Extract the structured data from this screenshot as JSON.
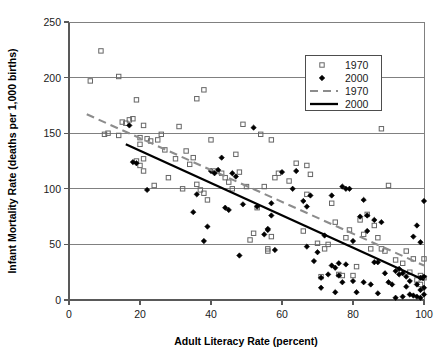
{
  "chart_data": {
    "type": "scatter",
    "title": "",
    "xlabel": "Adult Literacy Rate (percent)",
    "ylabel": "Infant Mortality Rate (deaths per 1,000 births)",
    "xlim": [
      0,
      100
    ],
    "ylim": [
      0,
      250
    ],
    "xticks": [
      "0",
      "20",
      "40",
      "60",
      "80",
      "100"
    ],
    "yticks": [
      "0",
      "50",
      "100",
      "150",
      "200",
      "250"
    ],
    "grid": "horizontal",
    "legend_position": "top-right",
    "legend": [
      {
        "label": "1970",
        "kind": "marker",
        "marker": "open-square",
        "color": "#666666"
      },
      {
        "label": "2000",
        "kind": "marker",
        "marker": "filled-diamond",
        "color": "#000000"
      },
      {
        "label": "1970",
        "kind": "line",
        "style": "dashed",
        "color": "#8c8c8c"
      },
      {
        "label": "2000",
        "kind": "line",
        "style": "solid",
        "color": "#000000"
      }
    ],
    "series": [
      {
        "name": "1970",
        "marker": "open-square",
        "color": "#666666",
        "points": [
          [
            6,
            197
          ],
          [
            9,
            224
          ],
          [
            10,
            149
          ],
          [
            11,
            150
          ],
          [
            14,
            201
          ],
          [
            14,
            148
          ],
          [
            15,
            160
          ],
          [
            16,
            159
          ],
          [
            17,
            162
          ],
          [
            18,
            163
          ],
          [
            19,
            180
          ],
          [
            19,
            125
          ],
          [
            20,
            146
          ],
          [
            20,
            140
          ],
          [
            20,
            121
          ],
          [
            21,
            116
          ],
          [
            21,
            127
          ],
          [
            21,
            157
          ],
          [
            22,
            145
          ],
          [
            23,
            143
          ],
          [
            24,
            103
          ],
          [
            25,
            144
          ],
          [
            26,
            149
          ],
          [
            27,
            135
          ],
          [
            28,
            110
          ],
          [
            30,
            127
          ],
          [
            31,
            156
          ],
          [
            32,
            100
          ],
          [
            33,
            134
          ],
          [
            34,
            122
          ],
          [
            35,
            128
          ],
          [
            36,
            104
          ],
          [
            36,
            181
          ],
          [
            37,
            99
          ],
          [
            38,
            189
          ],
          [
            38,
            96
          ],
          [
            39,
            90
          ],
          [
            40,
            144
          ],
          [
            41,
            116
          ],
          [
            43,
            114
          ],
          [
            44,
            110
          ],
          [
            45,
            106
          ],
          [
            46,
            100
          ],
          [
            47,
            131
          ],
          [
            48,
            115
          ],
          [
            49,
            158
          ],
          [
            50,
            102
          ],
          [
            51,
            54
          ],
          [
            52,
            60
          ],
          [
            53,
            83
          ],
          [
            54,
            149
          ],
          [
            55,
            102
          ],
          [
            56,
            44
          ],
          [
            56,
            46
          ],
          [
            57,
            57
          ],
          [
            57,
            144
          ],
          [
            58,
            110
          ],
          [
            59,
            114
          ],
          [
            62,
            107
          ],
          [
            64,
            123
          ],
          [
            66,
            62
          ],
          [
            67,
            95
          ],
          [
            67,
            121
          ],
          [
            68,
            113
          ],
          [
            70,
            51
          ],
          [
            71,
            21
          ],
          [
            72,
            46
          ],
          [
            73,
            50
          ],
          [
            74,
            87
          ],
          [
            75,
            70
          ],
          [
            76,
            23
          ],
          [
            77,
            22
          ],
          [
            78,
            56
          ],
          [
            79,
            63
          ],
          [
            80,
            22
          ],
          [
            81,
            30
          ],
          [
            82,
            72
          ],
          [
            83,
            59
          ],
          [
            84,
            77
          ],
          [
            85,
            46
          ],
          [
            86,
            67
          ],
          [
            87,
            56
          ],
          [
            88,
            154
          ],
          [
            88,
            46
          ],
          [
            89,
            44
          ],
          [
            90,
            103
          ],
          [
            92,
            36
          ],
          [
            94,
            33
          ],
          [
            95,
            44
          ],
          [
            96,
            25
          ],
          [
            97,
            37
          ],
          [
            98,
            18
          ],
          [
            99,
            22
          ],
          [
            99,
            14
          ],
          [
            100,
            37
          ],
          [
            100,
            20
          ]
        ]
      },
      {
        "name": "2000",
        "marker": "filled-diamond",
        "color": "#000000",
        "points": [
          [
            17,
            157
          ],
          [
            18,
            124
          ],
          [
            19,
            123
          ],
          [
            22,
            99
          ],
          [
            35,
            79
          ],
          [
            36,
            95
          ],
          [
            38,
            53
          ],
          [
            39,
            66
          ],
          [
            40,
            116
          ],
          [
            41,
            114
          ],
          [
            42,
            117
          ],
          [
            43,
            128
          ],
          [
            44,
            83
          ],
          [
            45,
            81
          ],
          [
            46,
            114
          ],
          [
            47,
            111
          ],
          [
            48,
            40
          ],
          [
            49,
            86
          ],
          [
            52,
            155
          ],
          [
            53,
            84
          ],
          [
            55,
            59
          ],
          [
            56,
            63
          ],
          [
            56,
            64
          ],
          [
            57,
            76
          ],
          [
            57,
            87
          ],
          [
            58,
            45
          ],
          [
            60,
            115
          ],
          [
            63,
            100
          ],
          [
            64,
            116
          ],
          [
            66,
            89
          ],
          [
            67,
            84
          ],
          [
            67,
            48
          ],
          [
            68,
            94
          ],
          [
            69,
            35
          ],
          [
            70,
            43
          ],
          [
            71,
            11
          ],
          [
            71,
            20
          ],
          [
            72,
            58
          ],
          [
            73,
            23
          ],
          [
            74,
            31
          ],
          [
            74,
            94
          ],
          [
            75,
            29
          ],
          [
            75,
            7
          ],
          [
            76,
            22
          ],
          [
            76,
            33
          ],
          [
            77,
            102
          ],
          [
            77,
            16
          ],
          [
            78,
            100
          ],
          [
            78,
            32
          ],
          [
            79,
            100
          ],
          [
            80,
            17
          ],
          [
            80,
            53
          ],
          [
            81,
            7
          ],
          [
            82,
            75
          ],
          [
            83,
            90
          ],
          [
            83,
            16
          ],
          [
            84,
            76
          ],
          [
            84,
            62
          ],
          [
            85,
            14
          ],
          [
            86,
            72
          ],
          [
            86,
            34
          ],
          [
            87,
            34
          ],
          [
            87,
            6
          ],
          [
            88,
            70
          ],
          [
            89,
            24
          ],
          [
            90,
            16
          ],
          [
            91,
            14
          ],
          [
            92,
            26
          ],
          [
            92,
            2
          ],
          [
            93,
            28
          ],
          [
            93,
            23
          ],
          [
            94,
            24
          ],
          [
            94,
            3
          ],
          [
            95,
            21
          ],
          [
            95,
            12
          ],
          [
            96,
            5
          ],
          [
            96,
            17
          ],
          [
            97,
            57
          ],
          [
            97,
            4
          ],
          [
            98,
            67
          ],
          [
            98,
            14
          ],
          [
            98,
            3
          ],
          [
            99,
            52
          ],
          [
            99,
            20
          ],
          [
            99,
            9
          ],
          [
            99,
            2
          ],
          [
            100,
            89
          ],
          [
            100,
            21
          ],
          [
            100,
            11
          ],
          [
            100,
            5
          ]
        ]
      }
    ],
    "trendlines": [
      {
        "name": "1970",
        "style": "dashed",
        "color": "#8c8c8c",
        "x0": 5,
        "y0": 167,
        "x1": 100,
        "y1": 31
      },
      {
        "name": "2000",
        "style": "solid",
        "color": "#000000",
        "x0": 16,
        "y0": 140,
        "x1": 100,
        "y1": 18
      }
    ]
  }
}
